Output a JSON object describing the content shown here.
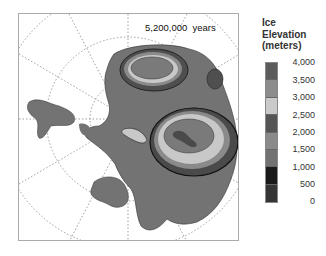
{
  "map": {
    "time_label": "5,200,000  years",
    "projection": "south polar stereographic",
    "subject": "Antarctica ice sheet simulation"
  },
  "legend": {
    "title_lines": [
      "Ice",
      "Elevation",
      "(meters)"
    ],
    "ticks": [
      "4,000",
      "3,500",
      "3,000",
      "2,500",
      "2,000",
      "1,500",
      "1,000",
      "500",
      "0"
    ],
    "swatch_colors": [
      "#5c5c5c",
      "#8c8c8c",
      "#cacaca",
      "#555555",
      "#8a8a8a",
      "#727272",
      "#1a1a1a",
      "#353535"
    ]
  },
  "colors": {
    "land": "#727272",
    "grid": "#777777",
    "frame": "#aaaaaa"
  }
}
